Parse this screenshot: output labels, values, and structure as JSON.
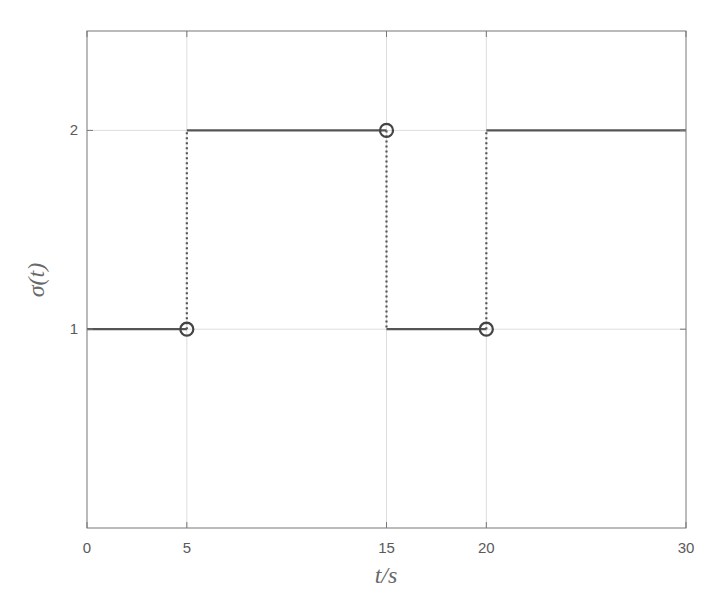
{
  "chart_data": {
    "type": "line",
    "subtype": "step",
    "title": "",
    "xlabel": "t/s",
    "ylabel": "σ(t)",
    "xlim": [
      0,
      30
    ],
    "ylim": [
      0,
      2.5
    ],
    "xticks": [
      0,
      5,
      15,
      20,
      30
    ],
    "xtick_labels": [
      "0",
      "5",
      "15",
      "20",
      "30"
    ],
    "yticks": [
      1,
      2
    ],
    "ytick_labels": [
      "1",
      "2"
    ],
    "grid": true,
    "legend": null,
    "series": [
      {
        "name": "sigma(t)",
        "style": "solid-horizontal-dotted-vertical",
        "x": [
          0,
          5,
          5,
          15,
          15,
          20,
          20,
          30
        ],
        "y": [
          1,
          1,
          2,
          2,
          1,
          1,
          2,
          2
        ]
      }
    ],
    "segments": [
      {
        "x_start": 0,
        "x_end": 5,
        "y": 1
      },
      {
        "x_start": 5,
        "x_end": 15,
        "y": 2
      },
      {
        "x_start": 15,
        "x_end": 20,
        "y": 1
      },
      {
        "x_start": 20,
        "x_end": 30,
        "y": 2
      }
    ],
    "switch_lines": [
      {
        "x": 5,
        "y_from": 1,
        "y_to": 2
      },
      {
        "x": 15,
        "y_from": 2,
        "y_to": 1
      },
      {
        "x": 20,
        "y_from": 1,
        "y_to": 2
      }
    ],
    "markers": [
      {
        "x": 5,
        "y": 1,
        "shape": "circle"
      },
      {
        "x": 15,
        "y": 2,
        "shape": "circle"
      },
      {
        "x": 20,
        "y": 1,
        "shape": "circle"
      }
    ],
    "colors": {
      "line": "#555555",
      "axis": "#777777",
      "grid": "#dddddd",
      "text": "#5a5a5a"
    }
  }
}
